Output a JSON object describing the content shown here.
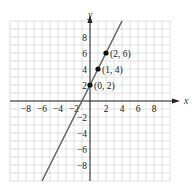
{
  "chart_data": {
    "type": "line",
    "title": "",
    "xlabel": "x",
    "ylabel": "y",
    "xlim": [
      -10,
      10
    ],
    "ylim": [
      -10,
      10
    ],
    "grid": true,
    "x_ticks": [
      -8,
      -6,
      -4,
      -2,
      2,
      4,
      6,
      8
    ],
    "y_ticks": [
      8,
      6,
      4,
      2,
      -2,
      -4,
      -6,
      -8
    ],
    "x_tick_labels": [
      "−8",
      "−6",
      "−4",
      "−2",
      "2",
      "4",
      "6",
      "8"
    ],
    "y_tick_labels": [
      "8",
      "6",
      "4",
      "2",
      "−2",
      "−4",
      "−6",
      "−8"
    ],
    "series": [
      {
        "name": "y = 2x + 2",
        "slope": 2,
        "intercept": 2,
        "x": [
          -6,
          4
        ],
        "y": [
          -10,
          10
        ],
        "color": "#666666"
      }
    ],
    "points": [
      {
        "x": 0,
        "y": 2,
        "label": "(0, 2)"
      },
      {
        "x": 1,
        "y": 4,
        "label": "(1, 4)"
      },
      {
        "x": 2,
        "y": 6,
        "label": "(2, 6)"
      }
    ]
  },
  "colors": {
    "grid": "#d8d8d8",
    "axis": "#222222",
    "line": "#666666",
    "point": "#111111"
  }
}
